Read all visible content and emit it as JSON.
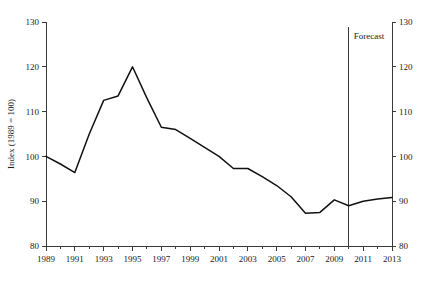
{
  "chart_data": {
    "type": "line",
    "title": "",
    "xlabel": "",
    "ylabel": "Index (1989 = 100)",
    "ylim": [
      80,
      130
    ],
    "xlim": [
      1989,
      2013
    ],
    "grid": false,
    "legend": false,
    "y_ticks": [
      80,
      90,
      100,
      110,
      120,
      130
    ],
    "y_ticks_right": [
      80,
      90,
      100,
      110,
      120,
      130
    ],
    "x_ticks": [
      1989,
      1990,
      1991,
      1992,
      1993,
      1994,
      1995,
      1996,
      1997,
      1998,
      1999,
      2000,
      2001,
      2002,
      2003,
      2004,
      2005,
      2006,
      2007,
      2008,
      2009,
      2010,
      2011,
      2012,
      2013
    ],
    "x_tick_labels": [
      "1989",
      "",
      "1991",
      "",
      "1993",
      "",
      "1995",
      "",
      "1997",
      "",
      "1999",
      "",
      "2001",
      "",
      "2003",
      "",
      "2005",
      "",
      "2007",
      "",
      "2009",
      "",
      "2011",
      "",
      "2013"
    ],
    "x": [
      1989,
      1990,
      1991,
      1992,
      1993,
      1994,
      1995,
      1996,
      1997,
      1998,
      1999,
      2000,
      2001,
      2002,
      2003,
      2004,
      2005,
      2006,
      2007,
      2008,
      2009,
      2010,
      2011,
      2012,
      2013
    ],
    "values": [
      100.0,
      98.3,
      96.4,
      105.0,
      112.5,
      113.5,
      120.0,
      113.0,
      106.5,
      106.0,
      104.0,
      102.0,
      100.0,
      97.3,
      97.3,
      95.5,
      93.5,
      91.0,
      87.3,
      87.5,
      90.3,
      89.0,
      90.0,
      90.5,
      90.8
    ],
    "annotations": [
      {
        "text": "Forecast",
        "x": 2010,
        "type": "vertical-line-with-label"
      }
    ]
  },
  "axis_titles": {
    "y_left": "Index (1989 = 100)"
  },
  "annotation_labels": {
    "forecast": "Forecast"
  }
}
